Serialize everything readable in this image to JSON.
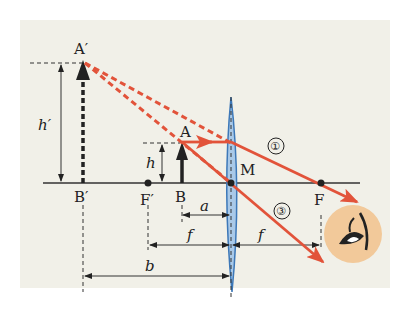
{
  "diagram": {
    "colors": {
      "background": "#f1f0e8",
      "ray": "#e2533a",
      "lens_fill": "#a9c9e8",
      "lens_stroke": "#3d78b8",
      "axis": "#333333",
      "eye_bg": "#f2c99a"
    },
    "labels": {
      "image_top": "A′",
      "image_base": "B′",
      "object_top": "A",
      "object_base": "B",
      "focal_left": "F′",
      "focal_right": "F",
      "lens_center": "M",
      "image_height": "h′",
      "object_height": "h",
      "object_distance": "a",
      "focal_length_left": "f",
      "focal_length_right": "f",
      "image_distance": "b",
      "ray_1": "①",
      "ray_3": "③"
    },
    "icons": {
      "eye": "eye-icon"
    }
  }
}
